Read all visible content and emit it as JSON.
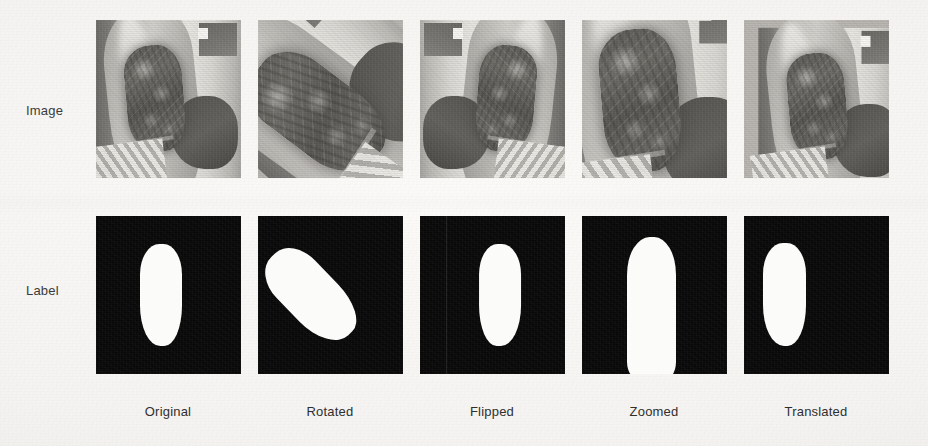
{
  "figure": {
    "type": "image-grid",
    "background_color": "#f4f3f1",
    "rows": [
      {
        "id": "image",
        "label": "Image"
      },
      {
        "id": "label",
        "label": "Label"
      }
    ],
    "columns": [
      {
        "id": "original",
        "label": "Original"
      },
      {
        "id": "rotated",
        "label": "Rotated"
      },
      {
        "id": "flipped",
        "label": "Flipped"
      },
      {
        "id": "zoomed",
        "label": "Zoomed"
      },
      {
        "id": "translated",
        "label": "Translated"
      }
    ],
    "panels": {
      "image_row": [
        {
          "caption": "Original",
          "content": "grayscale photograph of a skin lesion on a limb"
        },
        {
          "caption": "Rotated",
          "content": "grayscale photograph of a skin lesion on a limb"
        },
        {
          "caption": "Flipped",
          "content": "grayscale photograph of a skin lesion on a limb"
        },
        {
          "caption": "Zoomed",
          "content": "grayscale photograph of a skin lesion on a limb"
        },
        {
          "caption": "Translated",
          "content": "grayscale photograph of a skin lesion on a limb"
        }
      ],
      "label_row": [
        {
          "caption": "Original",
          "content": "binary segmentation mask, white lesion region on black background"
        },
        {
          "caption": "Rotated",
          "content": "binary segmentation mask, white lesion region on black background"
        },
        {
          "caption": "Flipped",
          "content": "binary segmentation mask, white lesion region on black background"
        },
        {
          "caption": "Zoomed",
          "content": "binary segmentation mask, white lesion region on black background"
        },
        {
          "caption": "Translated",
          "content": "binary segmentation mask, white lesion region on black background"
        }
      ]
    },
    "colors": {
      "mask_foreground": "#fbfbfa",
      "mask_background": "#080808",
      "text": "#2f2f2f"
    }
  }
}
